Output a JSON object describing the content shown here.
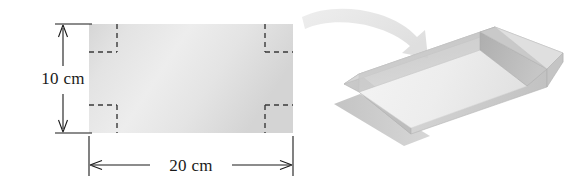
{
  "figure": {
    "background_color": "#ffffff"
  },
  "sheet": {
    "name": "rectangular-sheet",
    "fill_color": "#e2e2e2",
    "height_label": "10 cm",
    "width_label": "20 cm",
    "corner_cut_count": 4,
    "corner_cut_style": "dashed",
    "corner_cut_color": "#3a3a3a"
  },
  "dimensions": {
    "vertical": {
      "label": "10 cm",
      "orientation": "vertical",
      "arrow_style": "double-headed"
    },
    "horizontal": {
      "label": "20 cm",
      "orientation": "horizontal",
      "arrow_style": "double-headed"
    }
  },
  "transform_arrow": {
    "name": "curved-arrow",
    "color": "#e6e6e6",
    "direction": "left-to-right-curving-down"
  },
  "box": {
    "name": "open-box",
    "description": "open-top rectangular box",
    "top_face_color": "#dcdcdc",
    "front_face_color": "#cfcfcf",
    "side_face_color": "#c4c4c4",
    "inner_floor_color": "#f2f2f2",
    "inner_wall_color": "#b6b6b6",
    "shadow_color": "#b9b9b9"
  }
}
